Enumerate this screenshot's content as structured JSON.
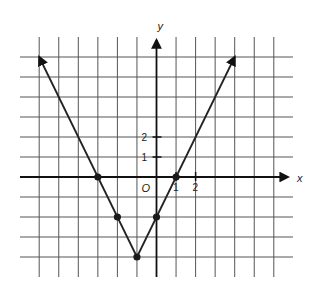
{
  "chart_data": {
    "type": "line",
    "title": "",
    "function": "y = 2|x + 1| - 4",
    "xlabel": "x",
    "ylabel": "y",
    "origin_label": "O",
    "xlim": [
      -7,
      7
    ],
    "ylim": [
      -5,
      7
    ],
    "grid": true,
    "x_tick_labels": [
      {
        "value": 1,
        "label": "1"
      },
      {
        "value": 2,
        "label": "2"
      }
    ],
    "y_tick_labels": [
      {
        "value": 1,
        "label": "1"
      },
      {
        "value": 2,
        "label": "2"
      }
    ],
    "series": [
      {
        "name": "graph",
        "x": [
          -6,
          -3,
          -2,
          -1,
          0,
          1,
          4
        ],
        "y": [
          6,
          0,
          -2,
          -4,
          -2,
          0,
          6
        ]
      }
    ],
    "marked_points": [
      [
        -3,
        0
      ],
      [
        -2,
        -2
      ],
      [
        -1,
        -4
      ],
      [
        0,
        -2
      ],
      [
        1,
        0
      ]
    ],
    "arrow_endpoints": [
      [
        -6,
        6
      ],
      [
        4,
        6
      ]
    ],
    "colors": {
      "line": "#222222",
      "grid": "#555555",
      "axis": "#111111"
    }
  }
}
